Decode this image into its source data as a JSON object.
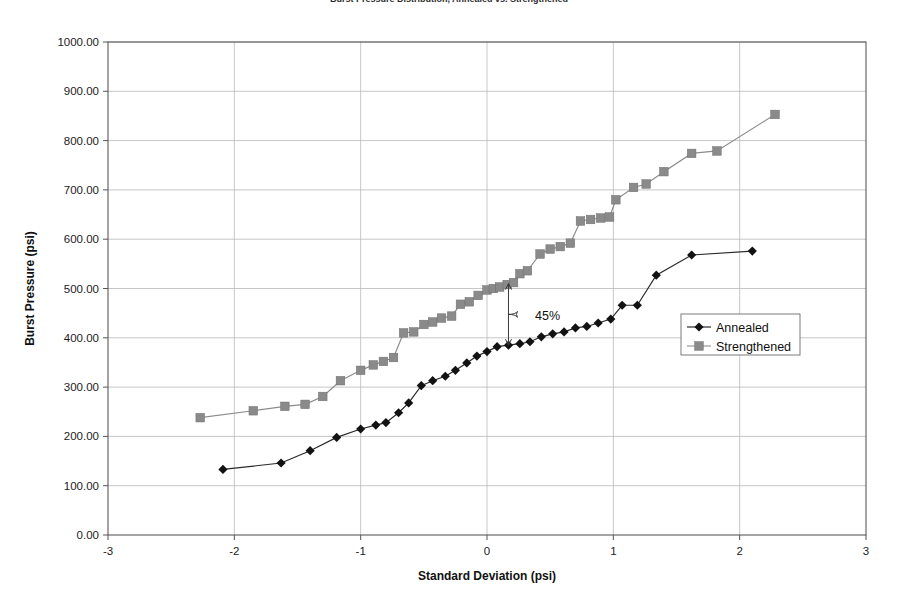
{
  "chart_data": {
    "type": "line",
    "title": "Burst Pressure Distribution, Annealed vs. Strengthened",
    "xlabel": "Standard Deviation (psi)",
    "ylabel": "Burst Pressure (psi)",
    "xlim": [
      -3,
      3
    ],
    "ylim": [
      0,
      1000
    ],
    "xticks": [
      -3,
      -2,
      -1,
      0,
      1,
      2,
      3
    ],
    "xtick_labels": [
      "-3",
      "-2",
      "-1",
      "0",
      "1",
      "2",
      "3"
    ],
    "yticks": [
      0,
      100,
      200,
      300,
      400,
      500,
      600,
      700,
      800,
      900,
      1000
    ],
    "ytick_labels": [
      "0.00",
      "100.00",
      "200.00",
      "300.00",
      "400.00",
      "500.00",
      "600.00",
      "700.00",
      "800.00",
      "900.00",
      "1000.00"
    ],
    "grid": true,
    "legend_position": "center-right",
    "series": [
      {
        "name": "Annealed",
        "color": "#121212",
        "marker": "diamond",
        "points": [
          [
            -2.09,
            133
          ],
          [
            -1.63,
            146
          ],
          [
            -1.4,
            171
          ],
          [
            -1.19,
            198
          ],
          [
            -1.0,
            215
          ],
          [
            -0.88,
            223
          ],
          [
            -0.8,
            228
          ],
          [
            -0.7,
            248
          ],
          [
            -0.62,
            268
          ],
          [
            -0.52,
            303
          ],
          [
            -0.43,
            313
          ],
          [
            -0.33,
            322
          ],
          [
            -0.25,
            334
          ],
          [
            -0.16,
            349
          ],
          [
            -0.08,
            363
          ],
          [
            0.0,
            372
          ],
          [
            0.08,
            382
          ],
          [
            0.17,
            385
          ],
          [
            0.26,
            388
          ],
          [
            0.34,
            392
          ],
          [
            0.43,
            402
          ],
          [
            0.52,
            408
          ],
          [
            0.61,
            412
          ],
          [
            0.7,
            420
          ],
          [
            0.79,
            423
          ],
          [
            0.88,
            430
          ],
          [
            0.98,
            438
          ],
          [
            1.07,
            466
          ],
          [
            1.19,
            466
          ],
          [
            1.34,
            527
          ],
          [
            1.62,
            568
          ],
          [
            2.1,
            576
          ]
        ]
      },
      {
        "name": "Strengthened",
        "color": "#8a8a8a",
        "marker": "square",
        "points": [
          [
            -2.27,
            238
          ],
          [
            -1.85,
            252
          ],
          [
            -1.6,
            261
          ],
          [
            -1.44,
            265
          ],
          [
            -1.3,
            281
          ],
          [
            -1.16,
            313
          ],
          [
            -1.0,
            334
          ],
          [
            -0.9,
            345
          ],
          [
            -0.82,
            352
          ],
          [
            -0.74,
            360
          ],
          [
            -0.66,
            410
          ],
          [
            -0.58,
            412
          ],
          [
            -0.5,
            427
          ],
          [
            -0.43,
            432
          ],
          [
            -0.36,
            440
          ],
          [
            -0.28,
            444
          ],
          [
            -0.21,
            468
          ],
          [
            -0.14,
            473
          ],
          [
            -0.07,
            486
          ],
          [
            0.0,
            497
          ],
          [
            0.05,
            500
          ],
          [
            0.1,
            503
          ],
          [
            0.16,
            508
          ],
          [
            0.21,
            512
          ],
          [
            0.26,
            530
          ],
          [
            0.32,
            536
          ],
          [
            0.42,
            570
          ],
          [
            0.5,
            580
          ],
          [
            0.58,
            585
          ],
          [
            0.66,
            592
          ],
          [
            0.74,
            637
          ],
          [
            0.82,
            640
          ],
          [
            0.9,
            643
          ],
          [
            0.97,
            645
          ],
          [
            1.02,
            680
          ],
          [
            1.16,
            705
          ],
          [
            1.26,
            712
          ],
          [
            1.4,
            737
          ],
          [
            1.62,
            774
          ],
          [
            1.82,
            779
          ],
          [
            2.28,
            853
          ]
        ]
      }
    ],
    "annotations": [
      {
        "label": "45%",
        "x": 0.17,
        "y_top": 510,
        "y_bottom": 385,
        "text_x": 0.38,
        "text_y": 447
      }
    ]
  }
}
